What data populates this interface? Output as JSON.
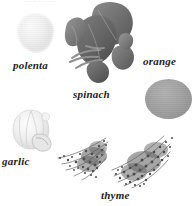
{
  "figure": {
    "top_caption": "........ ... .......",
    "background_color": "#ffffff",
    "style": "grayscale photographic plate of ingredients with italic serif labels"
  },
  "items": [
    {
      "id": "polenta",
      "label": "polenta",
      "shape": "rounded-blob",
      "tone": "very-light-gray",
      "color": "#ececec"
    },
    {
      "id": "spinach",
      "label": "spinach",
      "shape": "leaf-cluster",
      "tone": "dark-gray",
      "color": "#6d6d6d"
    },
    {
      "id": "orange",
      "label": "orange",
      "shape": "circle",
      "tone": "medium-gray",
      "color": "#a0a0a0"
    },
    {
      "id": "garlic",
      "label": "garlic",
      "shape": "bulb",
      "tone": "pale-gray",
      "color": "#e3e3e3"
    },
    {
      "id": "thyme",
      "label": "thyme",
      "shape": "sprig-bunches",
      "tone": "dark-speckled-gray",
      "color": "#5f5f5f"
    }
  ]
}
